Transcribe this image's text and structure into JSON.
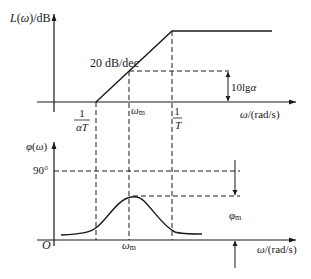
{
  "diagram": {
    "top_plot": {
      "ylabel": "L(ω)/dB",
      "xlabel": "ω/(rad/s)",
      "slope_label": "20 dB/dec",
      "corner_low": {
        "num": "1",
        "den": "αT"
      },
      "corner_high": {
        "num": "1",
        "den": "T"
      },
      "omega_m_label": "ωm",
      "gain_label": "10lgα"
    },
    "bottom_plot": {
      "ylabel": "φ(ω)",
      "xlabel": "ω/(rad/s)",
      "origin_label": "O",
      "ref_label": "90°",
      "omega_m_label": "ωm",
      "phase_max_label": "φm"
    },
    "colors": {
      "line": "#1a1a1a",
      "background": "#ffffff"
    }
  }
}
